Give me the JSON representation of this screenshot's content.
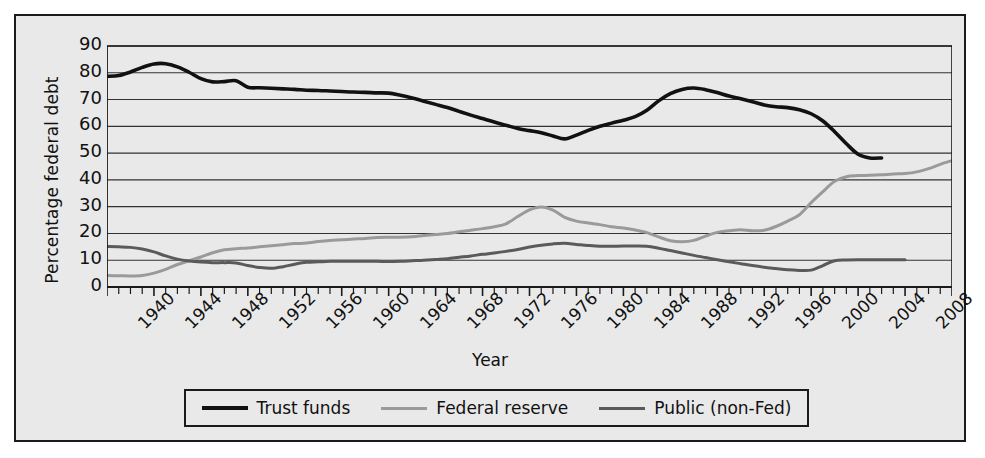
{
  "chart_data": {
    "type": "line",
    "title": "",
    "xlabel": "Year",
    "ylabel": "Percentage federal debt",
    "xlim": [
      1940,
      2012
    ],
    "ylim": [
      0,
      90
    ],
    "ytick_step": 10,
    "xtick_step": 4,
    "grid": true,
    "legend_position": "below",
    "yticks": [
      0,
      10,
      20,
      30,
      40,
      50,
      60,
      70,
      80,
      90
    ],
    "xticks": [
      1940,
      1944,
      1948,
      1952,
      1956,
      1960,
      1964,
      1968,
      1972,
      1976,
      1980,
      1984,
      1988,
      1992,
      1996,
      2000,
      2004,
      2008
    ],
    "colors": {
      "trust_funds": "#111111",
      "federal_reserve": "#9a9a9a",
      "public_non_fed": "#5a5a5a",
      "background": "#e9e9e9",
      "gridline": "#333333",
      "border": "#1b1b1b"
    },
    "series": [
      {
        "name": "Trust funds",
        "color": "#111111",
        "width": 3.6,
        "x": [
          1940,
          1941,
          1942,
          1943,
          1944,
          1945,
          1946,
          1947,
          1948,
          1949,
          1950,
          1951,
          1952,
          1953,
          1954,
          1955,
          1956,
          1957,
          1958,
          1959,
          1960,
          1961,
          1962,
          1963,
          1964,
          1965,
          1966,
          1967,
          1968,
          1969,
          1970,
          1971,
          1972,
          1973,
          1974,
          1975,
          1976,
          1977,
          1978,
          1979,
          1980,
          1981,
          1982,
          1983,
          1984,
          1985,
          1986,
          1987,
          1988,
          1989,
          1990,
          1991,
          1992,
          1993,
          1994,
          1995,
          1996,
          1997,
          1998,
          1999,
          2000,
          2001,
          2002,
          2003,
          2004,
          2005,
          2006
        ],
        "y": [
          78.7,
          79.0,
          80.3,
          82.0,
          83.3,
          83.4,
          82.2,
          80.2,
          77.8,
          76.6,
          76.7,
          77.0,
          74.6,
          74.4,
          74.2,
          74.0,
          73.8,
          73.5,
          73.4,
          73.2,
          73.0,
          72.8,
          72.7,
          72.5,
          72.4,
          71.6,
          70.6,
          69.4,
          68.2,
          67.0,
          65.6,
          64.2,
          62.9,
          61.6,
          60.4,
          59.2,
          58.4,
          57.6,
          56.4,
          55.3,
          56.7,
          58.5,
          60.0,
          61.2,
          62.3,
          63.6,
          66.0,
          69.5,
          72.2,
          73.8,
          74.3,
          73.7,
          72.6,
          71.3,
          70.3,
          69.2,
          68.0,
          67.3,
          67.0,
          66.2,
          64.7,
          62.0,
          58.0,
          53.5,
          49.6,
          48.2,
          48.2
        ]
      },
      {
        "name": "Federal reserve",
        "color": "#9a9a9a",
        "width": 3.0,
        "x": [
          1940,
          1941,
          1942,
          1943,
          1944,
          1945,
          1946,
          1947,
          1948,
          1949,
          1950,
          1951,
          1952,
          1953,
          1954,
          1955,
          1956,
          1957,
          1958,
          1959,
          1960,
          1961,
          1962,
          1963,
          1964,
          1965,
          1966,
          1967,
          1968,
          1969,
          1970,
          1971,
          1972,
          1973,
          1974,
          1975,
          1976,
          1977,
          1978,
          1979,
          1980,
          1981,
          1982,
          1983,
          1984,
          1985,
          1986,
          1987,
          1988,
          1989,
          1990,
          1991,
          1992,
          1993,
          1994,
          1995,
          1996,
          1997,
          1998,
          1999,
          2000,
          2001,
          2002,
          2003,
          2004,
          2005,
          2006,
          2007,
          2008,
          2009,
          2010,
          2011,
          2012
        ],
        "y": [
          4.3,
          4.2,
          4.1,
          4.3,
          5.2,
          6.6,
          8.4,
          9.8,
          11.2,
          12.8,
          13.9,
          14.3,
          14.6,
          15.0,
          15.4,
          15.8,
          16.2,
          16.4,
          17.0,
          17.4,
          17.6,
          17.9,
          18.1,
          18.5,
          18.6,
          18.6,
          18.8,
          19.2,
          19.6,
          20.0,
          20.6,
          21.2,
          21.8,
          22.5,
          23.6,
          26.3,
          28.8,
          29.9,
          28.7,
          26.0,
          24.6,
          23.9,
          23.3,
          22.5,
          22.0,
          21.3,
          20.3,
          18.7,
          17.3,
          16.9,
          17.4,
          19.0,
          20.4,
          21.0,
          21.4,
          21.0,
          21.2,
          22.6,
          24.6,
          27.0,
          31.5,
          35.6,
          39.5,
          41.2,
          41.6,
          41.7,
          41.9,
          42.2,
          42.4,
          43.0,
          44.2,
          45.8,
          47.2
        ]
      },
      {
        "name": "Public (non-Fed)",
        "color": "#5a5a5a",
        "width": 3.0,
        "x": [
          1940,
          1941,
          1942,
          1943,
          1944,
          1945,
          1946,
          1947,
          1948,
          1949,
          1950,
          1951,
          1952,
          1953,
          1954,
          1955,
          1956,
          1957,
          1958,
          1959,
          1960,
          1961,
          1962,
          1963,
          1964,
          1965,
          1966,
          1967,
          1968,
          1969,
          1970,
          1971,
          1972,
          1973,
          1974,
          1975,
          1976,
          1977,
          1978,
          1979,
          1980,
          1981,
          1982,
          1983,
          1984,
          1985,
          1986,
          1987,
          1988,
          1989,
          1990,
          1991,
          1992,
          1993,
          1994,
          1995,
          1996,
          1997,
          1998,
          1999,
          2000,
          2001,
          2002,
          2003,
          2004,
          2005,
          2006,
          2007,
          2008
        ],
        "y": [
          15.1,
          15.0,
          14.8,
          14.2,
          13.1,
          11.6,
          10.4,
          9.7,
          9.3,
          9.1,
          9.1,
          9.0,
          8.0,
          7.3,
          7.0,
          7.6,
          8.5,
          9.2,
          9.4,
          9.6,
          9.6,
          9.6,
          9.6,
          9.6,
          9.5,
          9.6,
          9.8,
          10.0,
          10.3,
          10.6,
          11.1,
          11.6,
          12.2,
          12.7,
          13.3,
          14.0,
          14.9,
          15.6,
          16.1,
          16.3,
          15.9,
          15.5,
          15.2,
          15.2,
          15.3,
          15.3,
          15.2,
          14.5,
          13.6,
          12.7,
          11.8,
          11.0,
          10.2,
          9.4,
          8.7,
          8.0,
          7.4,
          6.9,
          6.4,
          6.2,
          6.3,
          8.0,
          9.8,
          10.1,
          10.2,
          10.2,
          10.2,
          10.2,
          10.2
        ]
      }
    ]
  },
  "axes": {
    "y_title": "Percentage federal debt",
    "x_title": "Year",
    "y_tick_labels": [
      "90",
      "80",
      "70",
      "60",
      "50",
      "40",
      "30",
      "20",
      "10",
      "0"
    ],
    "x_tick_labels": [
      "1940",
      "1944",
      "1948",
      "1952",
      "1956",
      "1960",
      "1964",
      "1968",
      "1972",
      "1976",
      "1980",
      "1984",
      "1988",
      "1992",
      "1996",
      "2000",
      "2004",
      "2008"
    ]
  },
  "legend": {
    "entries": [
      {
        "label": "Trust funds",
        "color": "#111111",
        "thickness": "4px"
      },
      {
        "label": "Federal reserve",
        "color": "#9a9a9a",
        "thickness": "3px"
      },
      {
        "label": "Public (non-Fed)",
        "color": "#5a5a5a",
        "thickness": "3px"
      }
    ]
  }
}
